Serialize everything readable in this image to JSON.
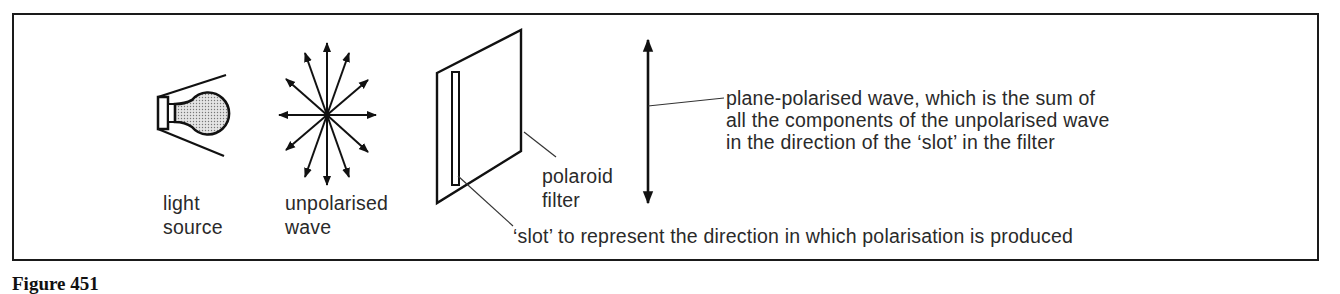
{
  "figure": {
    "caption": "Figure 451",
    "labels": {
      "light_source": [
        "light",
        "source"
      ],
      "unpolarised_wave": [
        "unpolarised",
        "wave"
      ],
      "polaroid_filter": [
        "polaroid",
        "filter"
      ],
      "plane_polarised": [
        "plane-polarised wave, which is the sum of",
        "all the components of the unpolarised wave",
        "in the direction of the ‘slot’ in the filter"
      ],
      "slot": "‘slot’ to represent the direction in which polarisation is produced"
    },
    "elements": [
      {
        "name": "light-bulb",
        "icon": "bulb-icon"
      },
      {
        "name": "unpolarised-wave",
        "icon": "star-arrows-icon",
        "arrow_count": 12
      },
      {
        "name": "polaroid-filter",
        "icon": "filter-sheet-icon"
      },
      {
        "name": "plane-polarised-wave",
        "icon": "double-arrow-vertical-icon"
      }
    ]
  }
}
